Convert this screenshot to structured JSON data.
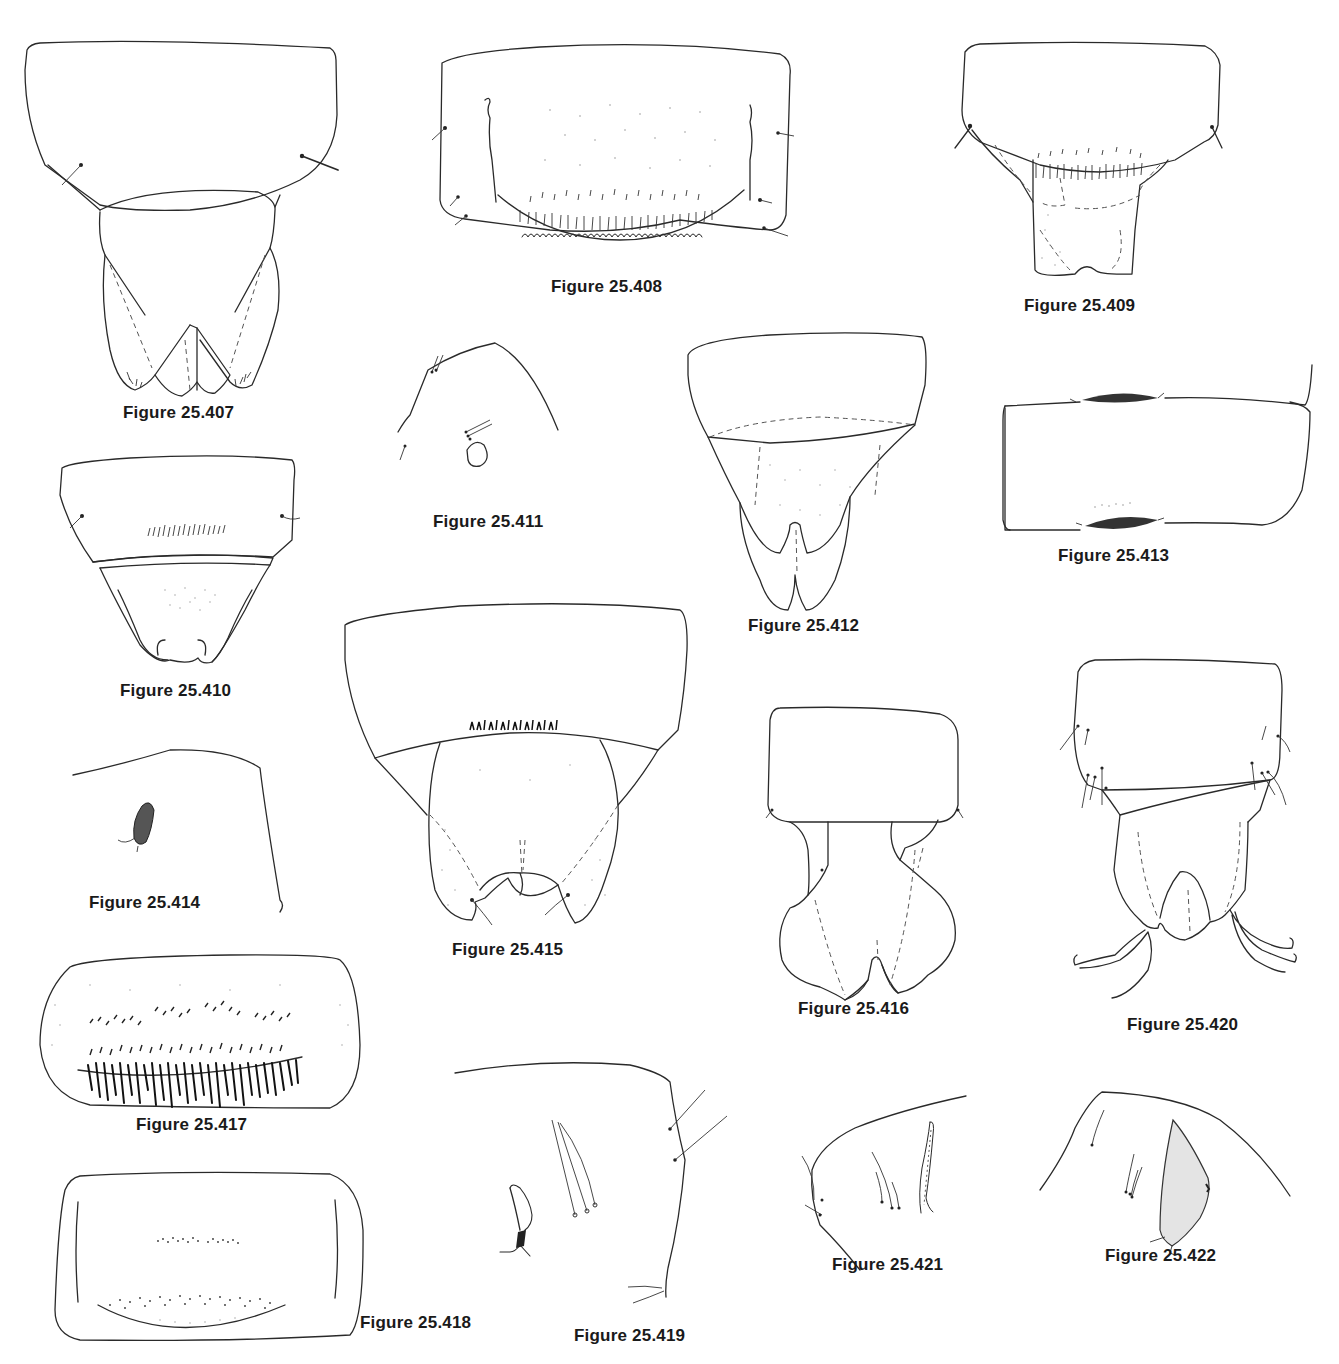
{
  "plate": {
    "background": "#ffffff",
    "ink_color": "#2a2a2a",
    "figures": [
      {
        "id": "407",
        "caption": "Figure 25.407"
      },
      {
        "id": "408",
        "caption": "Figure 25.408"
      },
      {
        "id": "409",
        "caption": "Figure 25.409"
      },
      {
        "id": "410",
        "caption": "Figure 25.410"
      },
      {
        "id": "411",
        "caption": "Figure 25.411"
      },
      {
        "id": "412",
        "caption": "Figure 25.412"
      },
      {
        "id": "413",
        "caption": "Figure 25.413"
      },
      {
        "id": "414",
        "caption": "Figure 25.414"
      },
      {
        "id": "415",
        "caption": "Figure 25.415"
      },
      {
        "id": "416",
        "caption": "Figure 25.416"
      },
      {
        "id": "417",
        "caption": "Figure 25.417"
      },
      {
        "id": "418",
        "caption": "Figure 25.418"
      },
      {
        "id": "419",
        "caption": "Figure 25.419"
      },
      {
        "id": "420",
        "caption": "Figure 25.420"
      },
      {
        "id": "421",
        "caption": "Figure 25.421"
      },
      {
        "id": "422",
        "caption": "Figure 25.422"
      }
    ]
  }
}
